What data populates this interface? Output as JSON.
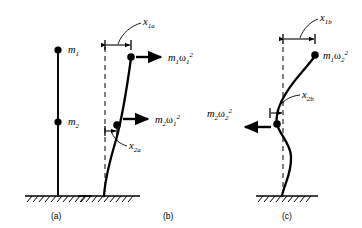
{
  "figure": {
    "background_color": "#ffffff",
    "ink_color": "#000000",
    "panels": [
      {
        "id": "a",
        "caption": "(a)",
        "description": "undeformed cantilever column with two lumped masses",
        "mass_labels": [
          {
            "name": "mass-1-label",
            "base": "m",
            "sub": "1"
          },
          {
            "name": "mass-2-label",
            "base": "m",
            "sub": "2"
          }
        ]
      },
      {
        "id": "b",
        "caption": "(b)",
        "description": "first mode shape, both inertia forces act to the right",
        "displacement_labels": [
          {
            "name": "x-1a-label",
            "base": "x",
            "sub": "1a"
          },
          {
            "name": "x-2a-label",
            "base": "x",
            "sub": "2a"
          }
        ],
        "force_labels": [
          {
            "name": "force-m1-omega1-label",
            "base": "m",
            "sub": "1",
            "greek": "ω",
            "greek_sub": "1",
            "sup": "2",
            "direction": "right"
          },
          {
            "name": "force-m2-omega1-label",
            "base": "m",
            "sub": "2",
            "greek": "ω",
            "greek_sub": "1",
            "sup": "2",
            "direction": "right"
          }
        ]
      },
      {
        "id": "c",
        "caption": "(c)",
        "description": "second mode shape with inflection, upper force right and lower force left",
        "displacement_labels": [
          {
            "name": "x-1b-label",
            "base": "x",
            "sub": "1b"
          },
          {
            "name": "x-2b-label",
            "base": "x",
            "sub": "2b"
          }
        ],
        "force_labels": [
          {
            "name": "force-m1-omega2-label",
            "base": "m",
            "sub": "1",
            "greek": "ω",
            "greek_sub": "2",
            "sup": "2",
            "direction": "none"
          },
          {
            "name": "force-m2-omega2-label",
            "base": "m",
            "sub": "2",
            "greek": "ω",
            "greek_sub": "2",
            "sup": "2",
            "direction": "left"
          }
        ]
      }
    ],
    "text": {
      "m": "m",
      "x": "x",
      "omega": "ω",
      "sub_1": "1",
      "sub_2": "2",
      "sub_1a": "1a",
      "sub_2a": "2a",
      "sub_1b": "1b",
      "sub_2b": "2b",
      "sup_2": "2",
      "caption_a": "(a)",
      "caption_b": "(b)",
      "caption_c": "(c)"
    }
  }
}
